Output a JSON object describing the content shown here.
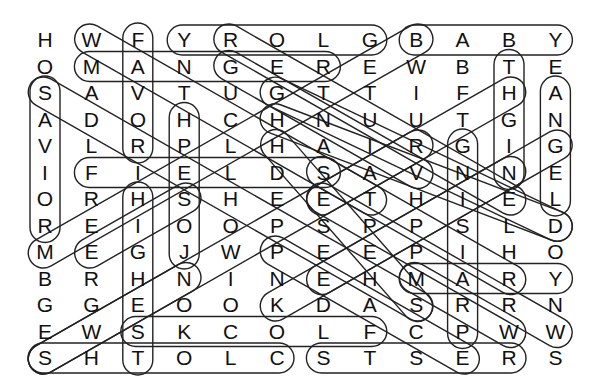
{
  "puzzle": {
    "type": "word-search",
    "cols": 12,
    "rows": 13,
    "grid": [
      [
        "H",
        "W",
        "F",
        "Y",
        "R",
        "O",
        "L",
        "G",
        "B",
        "A",
        "B",
        "Y"
      ],
      [
        "O",
        "M",
        "A",
        "N",
        "G",
        "E",
        "R",
        "E",
        "W",
        "B",
        "T",
        "E"
      ],
      [
        "S",
        "A",
        "V",
        "T",
        "U",
        "G",
        "T",
        "T",
        "I",
        "F",
        "H",
        "A"
      ],
      [
        "A",
        "D",
        "O",
        "H",
        "C",
        "H",
        "N",
        "U",
        "U",
        "T",
        "G",
        "N"
      ],
      [
        "V",
        "L",
        "R",
        "P",
        "L",
        "H",
        "A",
        "I",
        "R",
        "G",
        "I",
        "G"
      ],
      [
        "I",
        "F",
        "I",
        "E",
        "L",
        "D",
        "S",
        "A",
        "V",
        "N",
        "N",
        "E"
      ],
      [
        "O",
        "R",
        "H",
        "S",
        "H",
        "E",
        "E",
        "T",
        "H",
        "I",
        "E",
        "L"
      ],
      [
        "R",
        "E",
        "I",
        "O",
        "O",
        "P",
        "S",
        "P",
        "P",
        "S",
        "L",
        "D"
      ],
      [
        "M",
        "E",
        "G",
        "J",
        "W",
        "P",
        "E",
        "E",
        "P",
        "I",
        "H",
        "O"
      ],
      [
        "B",
        "R",
        "H",
        "N",
        "I",
        "N",
        "E",
        "H",
        "M",
        "A",
        "R",
        "Y"
      ],
      [
        "G",
        "G",
        "E",
        "O",
        "O",
        "K",
        "D",
        "A",
        "S",
        "R",
        "R",
        "N"
      ],
      [
        "E",
        "W",
        "S",
        "K",
        "C",
        "O",
        "L",
        "F",
        "C",
        "P",
        "W",
        "W"
      ],
      [
        "S",
        "H",
        "T",
        "O",
        "L",
        "C",
        "S",
        "T",
        "S",
        "E",
        "R",
        "S"
      ]
    ],
    "found_words": [
      {
        "word": "GLORY",
        "start": [
          0,
          7
        ],
        "end": [
          0,
          3
        ]
      },
      {
        "word": "BABY",
        "start": [
          0,
          8
        ],
        "end": [
          0,
          11
        ]
      },
      {
        "word": "MANGER",
        "start": [
          1,
          1
        ],
        "end": [
          1,
          6
        ]
      },
      {
        "word": "FIELDS",
        "start": [
          5,
          1
        ],
        "end": [
          5,
          6
        ]
      },
      {
        "word": "MARY",
        "start": [
          9,
          8
        ],
        "end": [
          9,
          11
        ]
      },
      {
        "word": "FLOCKS",
        "start": [
          11,
          7
        ],
        "end": [
          11,
          2
        ]
      },
      {
        "word": "CLOTHS",
        "start": [
          12,
          5
        ],
        "end": [
          12,
          0
        ]
      },
      {
        "word": "RESTS",
        "start": [
          12,
          10
        ],
        "end": [
          12,
          6
        ]
      },
      {
        "word": "FAVOR",
        "start": [
          0,
          2
        ],
        "end": [
          4,
          2
        ]
      },
      {
        "word": "SAVIOR",
        "start": [
          2,
          0
        ],
        "end": [
          7,
          0
        ]
      },
      {
        "word": "JOSEPH",
        "start": [
          8,
          3
        ],
        "end": [
          3,
          3
        ]
      },
      {
        "word": "HIGHEST",
        "start": [
          6,
          2
        ],
        "end": [
          12,
          2
        ]
      },
      {
        "word": "NIGHT",
        "start": [
          5,
          10
        ],
        "end": [
          1,
          10
        ]
      },
      {
        "word": "ANGEL",
        "start": [
          2,
          11
        ],
        "end": [
          6,
          11
        ]
      },
      {
        "word": "PRAISING",
        "start": [
          11,
          9
        ],
        "end": [
          4,
          9
        ]
      },
      {
        "word": "WORSHIP",
        "start": [
          0,
          1
        ],
        "end": [
          6,
          7
        ]
      },
      {
        "word": "REJOICE",
        "start": [
          0,
          4
        ],
        "end": [
          6,
          10
        ]
      },
      {
        "word": "GREAT",
        "start": [
          1,
          4
        ],
        "end": [
          5,
          8
        ]
      },
      {
        "word": "SHEPHERDS",
        "start": [
          2,
          0
        ],
        "end": [
          10,
          8
        ]
      },
      {
        "word": "SHEEP",
        "start": [
          5,
          6
        ],
        "end": [
          9,
          10
        ]
      },
      {
        "word": "GUDINGLEDGE",
        "start": [
          2,
          5
        ],
        "end": [
          7,
          11
        ]
      },
      {
        "word": "HOLIDAY",
        "start": [
          3,
          5
        ],
        "end": [
          7,
          11
        ]
      },
      {
        "word": "BETHLEHEM",
        "start": [
          0,
          8
        ],
        "end": [
          8,
          0
        ]
      },
      {
        "word": "SPIRIT",
        "start": [
          12,
          0
        ],
        "end": [
          4,
          8
        ]
      },
      {
        "word": "HEAVENS",
        "start": [
          4,
          5
        ],
        "end": [
          10,
          8
        ]
      },
      {
        "word": "PEACE",
        "start": [
          8,
          5
        ],
        "end": [
          12,
          9
        ]
      },
      {
        "word": "KINGS",
        "start": [
          10,
          5
        ],
        "end": [
          5,
          10
        ]
      },
      {
        "word": "HEART",
        "start": [
          2,
          10
        ],
        "end": [
          6,
          6
        ]
      },
      {
        "word": "STREW",
        "start": [
          9,
          8
        ],
        "end": [
          11,
          10
        ]
      },
      {
        "word": "NEWS",
        "start": [
          9,
          3
        ],
        "end": [
          12,
          0
        ]
      },
      {
        "word": "SAVIOUR",
        "start": [
          6,
          3
        ],
        "end": [
          8,
          1
        ]
      },
      {
        "word": "WISEMEN",
        "start": [
          6,
          6
        ],
        "end": [
          11,
          11
        ]
      },
      {
        "word": "GIFTS",
        "start": [
          4,
          11
        ],
        "end": [
          9,
          6
        ]
      }
    ]
  }
}
